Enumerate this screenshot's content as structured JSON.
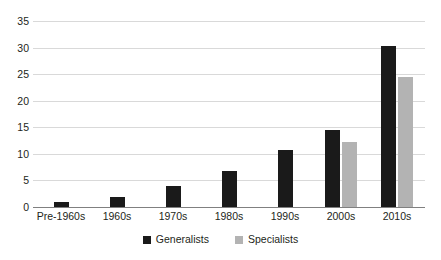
{
  "chart_data": {
    "type": "bar",
    "title": "",
    "subtitle": "",
    "xlabel": "",
    "ylabel": "",
    "categories": [
      "Pre-1960s",
      "1960s",
      "1970s",
      "1980s",
      "1990s",
      "2000s",
      "2010s"
    ],
    "series": [
      {
        "name": "Generalists",
        "color": "#1a1a1a",
        "values": [
          1.0,
          1.8,
          4.0,
          6.7,
          10.7,
          14.5,
          30.3
        ]
      },
      {
        "name": "Specialists",
        "color": "#b3b3b3",
        "values": [
          0,
          0,
          0,
          0,
          0,
          12.3,
          24.5
        ]
      }
    ],
    "ylim": [
      0,
      35
    ],
    "yticks": [
      0,
      5,
      10,
      15,
      20,
      25,
      30,
      35
    ],
    "ytick_labels": [
      "0",
      "5",
      "10",
      "15",
      "20",
      "25",
      "30",
      "35"
    ],
    "grid": true,
    "grid_axis": "y",
    "legend_position": "bottom",
    "legend": [
      "Generalists",
      "Specialists"
    ],
    "background_color": "#ffffff",
    "gridline_color": "#d9d9d9",
    "axis_color": "#808080"
  }
}
